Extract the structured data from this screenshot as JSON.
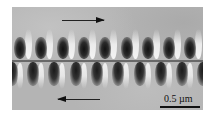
{
  "figure": {
    "scale_bar": {
      "label": "0.5 µm"
    },
    "arrows": [
      {
        "direction": "right",
        "position": "top"
      },
      {
        "direction": "left",
        "position": "bottom"
      }
    ],
    "colors": {
      "background": "#b4b4b4",
      "dark_spot": "#111111",
      "bright_band": "#f0f0f0"
    }
  }
}
